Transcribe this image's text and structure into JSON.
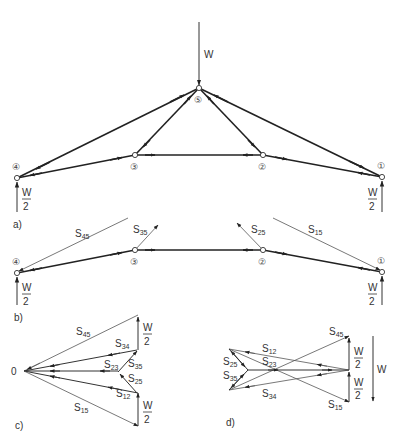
{
  "figure": {
    "panels": [
      {
        "id": "a",
        "label": "a)"
      },
      {
        "id": "b",
        "label": "b)"
      },
      {
        "id": "c",
        "label": "c)"
      },
      {
        "id": "d",
        "label": "d)"
      }
    ],
    "loads": {
      "top_load": "W",
      "support_numerator": "W",
      "support_denominator": "2"
    },
    "nodes": {
      "n1": "①",
      "n2": "②",
      "n3": "③",
      "n4": "④",
      "n5": "⑤"
    },
    "members": {
      "s45": {
        "main": "S",
        "sub": "45"
      },
      "s35": {
        "main": "S",
        "sub": "35"
      },
      "s25": {
        "main": "S",
        "sub": "25"
      },
      "s15": {
        "main": "S",
        "sub": "15"
      },
      "s34": {
        "main": "S",
        "sub": "34"
      },
      "s23": {
        "main": "S",
        "sub": "23"
      },
      "s12": {
        "main": "S",
        "sub": "12"
      }
    },
    "polygon_c": {
      "origin_label": "0"
    },
    "polygon_d": {
      "total_load": "W"
    }
  }
}
